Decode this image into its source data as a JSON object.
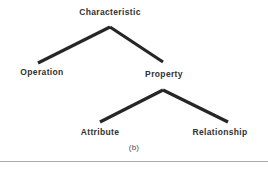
{
  "figure": {
    "caption": "(b)",
    "line_color": "#262626",
    "text_color": "#232323",
    "background_color": "#ffffff",
    "rule_color": "#9a9a9a"
  },
  "tree": {
    "nodes": {
      "root": "Characteristic",
      "left_child": "Operation",
      "right_child": "Property",
      "right_left_grandchild": "Attribute",
      "right_right_grandchild": "Relationship"
    },
    "edges": [
      {
        "from": "Characteristic",
        "to": "Operation"
      },
      {
        "from": "Characteristic",
        "to": "Property"
      },
      {
        "from": "Property",
        "to": "Attribute"
      },
      {
        "from": "Property",
        "to": "Relationship"
      }
    ]
  },
  "geometry": {
    "upper_apex": {
      "x": 110,
      "y": 27
    },
    "upper_left_end": {
      "x": 38,
      "y": 63
    },
    "upper_right_end": {
      "x": 163,
      "y": 62
    },
    "lower_apex": {
      "x": 163,
      "y": 90
    },
    "lower_left_end": {
      "x": 100,
      "y": 122
    },
    "lower_right_end": {
      "x": 228,
      "y": 122
    },
    "stroke_width": 3.2
  }
}
